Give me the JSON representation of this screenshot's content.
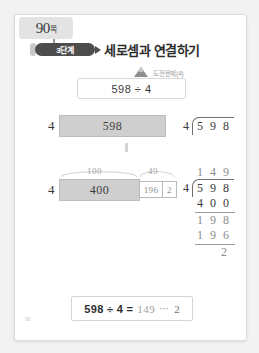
{
  "page_tab": {
    "label": "90",
    "unit": "쪽"
  },
  "header": {
    "badge": "3단계",
    "title": "세로셈과 연결하기",
    "sprout_icon": "sprout-icon",
    "arrow_icon": "triangle-right-icon"
  },
  "challenge": {
    "icon": "mountain-icon",
    "label": "도전문제(4)",
    "expression": "598 ÷ 4"
  },
  "model": {
    "row1": {
      "divisor": "4",
      "bar_value": "598"
    },
    "row2": {
      "divisor": "4",
      "brace_left": "100",
      "brace_right": "49",
      "bar_value": "400",
      "cell_1": "196",
      "cell_2": "2"
    }
  },
  "long_division": {
    "quotient": "1 4 9",
    "divisor": "4",
    "dividend": "5 9 8",
    "step1": "4 0 0",
    "step2": "1 9 8",
    "step3": "1 9 6",
    "remainder": "2"
  },
  "answer": {
    "expression": "598 ÷ 4 =",
    "quotient": "149",
    "dots": "⋯",
    "remainder": "2"
  },
  "footer": {
    "page_number": "90"
  }
}
